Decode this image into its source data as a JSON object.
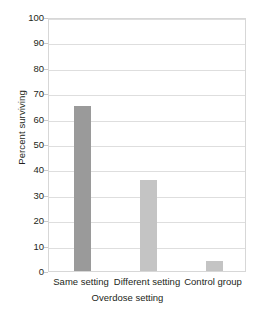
{
  "chart_data": {
    "type": "bar",
    "title": "",
    "subtitle": "",
    "categories": [
      "Same setting",
      "Different setting",
      "Control group"
    ],
    "values": [
      65,
      36,
      4
    ],
    "xlabel": "Overdose setting",
    "ylabel": "Percent surviving",
    "ylim": [
      0,
      100
    ],
    "ytick_labels": [
      "100",
      "90",
      "80",
      "70",
      "60",
      "50",
      "40",
      "30",
      "20",
      "10",
      "0"
    ],
    "ytick_values": [
      100,
      90,
      80,
      70,
      60,
      50,
      40,
      30,
      20,
      10,
      0
    ],
    "ytick_step": 10,
    "grid": true,
    "grid_axis": "y",
    "legend": false,
    "legend_position": "none",
    "bar_colors": [
      "#9a9a9a",
      "#c4c4c4",
      "#c4c4c4"
    ],
    "bar_width_px": 17,
    "plot_background": "#ffffff",
    "grid_color": "#dedede",
    "frame_color": "#d7d7d7",
    "text_color": "#231f20"
  }
}
